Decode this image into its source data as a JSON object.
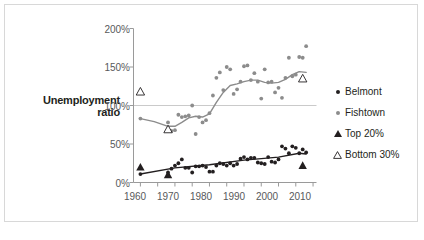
{
  "figure": {
    "y_axis_title_line1": "Unemployment",
    "y_axis_title_line2": "ratio",
    "border_color": "#d8d8d8",
    "background": "#ffffff"
  },
  "legend": {
    "position": "right",
    "items": [
      {
        "label": "Belmont",
        "marker": "filled-circle",
        "color": "#231f20",
        "icon": "dot-icon"
      },
      {
        "label": "Fishtown",
        "marker": "filled-circle",
        "color": "#8c8c8c",
        "icon": "dot-icon"
      },
      {
        "label": "Top 20%",
        "marker": "filled-triangle",
        "color": "#231f20",
        "icon": "triangle-filled-icon"
      },
      {
        "label": "Bottom 30%",
        "marker": "open-triangle",
        "color": "#231f20",
        "icon": "triangle-open-icon"
      }
    ]
  },
  "chart_data": {
    "type": "scatter",
    "title": "",
    "xlabel": "",
    "ylabel": "Unemployment ratio",
    "xlim": [
      1958,
      2011
    ],
    "ylim": [
      0,
      200
    ],
    "yticks": [
      0,
      50,
      100,
      150,
      200
    ],
    "ytick_labels": [
      "0%",
      "50%",
      "100%",
      "150%",
      "200%"
    ],
    "xticks": [
      1960,
      1965,
      1970,
      1975,
      1980,
      1985,
      1990,
      1995,
      2000,
      2005,
      2010
    ],
    "xtick_labels": [
      "1960",
      "",
      "1970",
      "",
      "1980",
      "",
      "1990",
      "",
      "2000",
      "",
      "2010"
    ],
    "xtick_labels_shown": [
      "1960",
      "1970",
      "1980",
      "1990",
      "2000",
      "2010"
    ],
    "grid": "horizontal-at-100",
    "gridlines": [
      100
    ],
    "series": [
      {
        "name": "Fishtown",
        "marker": "filled-circle",
        "color": "#8c8c8c",
        "points": [
          {
            "x": 1960,
            "y": 83
          },
          {
            "x": 1968,
            "y": 78
          },
          {
            "x": 1969,
            "y": 67
          },
          {
            "x": 1970,
            "y": 68
          },
          {
            "x": 1971,
            "y": 88
          },
          {
            "x": 1972,
            "y": 85
          },
          {
            "x": 1973,
            "y": 86
          },
          {
            "x": 1974,
            "y": 87
          },
          {
            "x": 1975,
            "y": 100
          },
          {
            "x": 1976,
            "y": 63
          },
          {
            "x": 1977,
            "y": 85
          },
          {
            "x": 1978,
            "y": 78
          },
          {
            "x": 1979,
            "y": 81
          },
          {
            "x": 1980,
            "y": 90
          },
          {
            "x": 1981,
            "y": 113
          },
          {
            "x": 1982,
            "y": 136
          },
          {
            "x": 1983,
            "y": 143
          },
          {
            "x": 1984,
            "y": 120
          },
          {
            "x": 1985,
            "y": 150
          },
          {
            "x": 1986,
            "y": 147
          },
          {
            "x": 1987,
            "y": 115
          },
          {
            "x": 1988,
            "y": 121
          },
          {
            "x": 1989,
            "y": 131
          },
          {
            "x": 1990,
            "y": 151
          },
          {
            "x": 1991,
            "y": 152
          },
          {
            "x": 1992,
            "y": 133
          },
          {
            "x": 1993,
            "y": 142
          },
          {
            "x": 1994,
            "y": 131
          },
          {
            "x": 1995,
            "y": 109
          },
          {
            "x": 1996,
            "y": 147
          },
          {
            "x": 1997,
            "y": 130
          },
          {
            "x": 1998,
            "y": 131
          },
          {
            "x": 1999,
            "y": 117
          },
          {
            "x": 2000,
            "y": 123
          },
          {
            "x": 2001,
            "y": 110
          },
          {
            "x": 2002,
            "y": 136
          },
          {
            "x": 2003,
            "y": 162
          },
          {
            "x": 2004,
            "y": 138
          },
          {
            "x": 2005,
            "y": 140
          },
          {
            "x": 2006,
            "y": 163
          },
          {
            "x": 2007,
            "y": 162
          },
          {
            "x": 2008,
            "y": 177
          }
        ],
        "trend_line": [
          {
            "x": 1960,
            "y": 83
          },
          {
            "x": 1964,
            "y": 79
          },
          {
            "x": 1968,
            "y": 73
          },
          {
            "x": 1970,
            "y": 73
          },
          {
            "x": 1972,
            "y": 78
          },
          {
            "x": 1974,
            "y": 84
          },
          {
            "x": 1976,
            "y": 86
          },
          {
            "x": 1978,
            "y": 85
          },
          {
            "x": 1980,
            "y": 89
          },
          {
            "x": 1982,
            "y": 104
          },
          {
            "x": 1984,
            "y": 117
          },
          {
            "x": 1986,
            "y": 126
          },
          {
            "x": 1988,
            "y": 128
          },
          {
            "x": 1990,
            "y": 131
          },
          {
            "x": 1992,
            "y": 133
          },
          {
            "x": 1994,
            "y": 133
          },
          {
            "x": 1996,
            "y": 130
          },
          {
            "x": 1998,
            "y": 129
          },
          {
            "x": 2000,
            "y": 130
          },
          {
            "x": 2002,
            "y": 134
          },
          {
            "x": 2004,
            "y": 140
          },
          {
            "x": 2006,
            "y": 144
          },
          {
            "x": 2008,
            "y": 143
          }
        ]
      },
      {
        "name": "Belmont",
        "marker": "filled-circle",
        "color": "#231f20",
        "points": [
          {
            "x": 1960,
            "y": 11
          },
          {
            "x": 1968,
            "y": 13
          },
          {
            "x": 1969,
            "y": 18
          },
          {
            "x": 1970,
            "y": 22
          },
          {
            "x": 1971,
            "y": 25
          },
          {
            "x": 1972,
            "y": 30
          },
          {
            "x": 1973,
            "y": 19
          },
          {
            "x": 1974,
            "y": 19
          },
          {
            "x": 1975,
            "y": 13
          },
          {
            "x": 1976,
            "y": 21
          },
          {
            "x": 1977,
            "y": 21
          },
          {
            "x": 1978,
            "y": 22
          },
          {
            "x": 1979,
            "y": 20
          },
          {
            "x": 1980,
            "y": 14
          },
          {
            "x": 1981,
            "y": 14
          },
          {
            "x": 1982,
            "y": 22
          },
          {
            "x": 1983,
            "y": 25
          },
          {
            "x": 1984,
            "y": 24
          },
          {
            "x": 1985,
            "y": 22
          },
          {
            "x": 1986,
            "y": 25
          },
          {
            "x": 1987,
            "y": 22
          },
          {
            "x": 1988,
            "y": 24
          },
          {
            "x": 1989,
            "y": 31
          },
          {
            "x": 1990,
            "y": 33
          },
          {
            "x": 1991,
            "y": 30
          },
          {
            "x": 1992,
            "y": 32
          },
          {
            "x": 1993,
            "y": 32
          },
          {
            "x": 1994,
            "y": 26
          },
          {
            "x": 1995,
            "y": 25
          },
          {
            "x": 1996,
            "y": 24
          },
          {
            "x": 1997,
            "y": 33
          },
          {
            "x": 1998,
            "y": 27
          },
          {
            "x": 1999,
            "y": 26
          },
          {
            "x": 2000,
            "y": 30
          },
          {
            "x": 2001,
            "y": 47
          },
          {
            "x": 2002,
            "y": 44
          },
          {
            "x": 2003,
            "y": 38
          },
          {
            "x": 2004,
            "y": 47
          },
          {
            "x": 2005,
            "y": 45
          },
          {
            "x": 2006,
            "y": 38
          },
          {
            "x": 2007,
            "y": 43
          },
          {
            "x": 2008,
            "y": 39
          }
        ],
        "trend_line": [
          {
            "x": 1960,
            "y": 11
          },
          {
            "x": 1970,
            "y": 19
          },
          {
            "x": 1980,
            "y": 23
          },
          {
            "x": 1990,
            "y": 29
          },
          {
            "x": 2000,
            "y": 33
          },
          {
            "x": 2006,
            "y": 38
          },
          {
            "x": 2008,
            "y": 37
          }
        ]
      },
      {
        "name": "Top 20%",
        "marker": "filled-triangle",
        "color": "#231f20",
        "points": [
          {
            "x": 1960,
            "y": 20
          },
          {
            "x": 1968,
            "y": 10
          },
          {
            "x": 2007,
            "y": 22
          }
        ]
      },
      {
        "name": "Bottom 30%",
        "marker": "open-triangle",
        "color": "#231f20",
        "points": [
          {
            "x": 1960,
            "y": 118
          },
          {
            "x": 1968,
            "y": 69
          },
          {
            "x": 2007,
            "y": 135
          }
        ]
      }
    ]
  }
}
